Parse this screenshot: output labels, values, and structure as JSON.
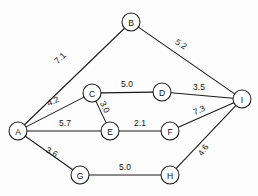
{
  "diagram": {
    "type": "weighted-undirected-graph",
    "title": "",
    "background_color": "#fdfdfd",
    "stroke_color": "#1a1a1a",
    "node_fill_color": "#ffffff",
    "node_radius": 9,
    "nodes": [
      {
        "id": "A",
        "label": "A",
        "x": 18,
        "y": 131
      },
      {
        "id": "B",
        "label": "B",
        "x": 131,
        "y": 22
      },
      {
        "id": "C",
        "label": "C",
        "x": 92,
        "y": 93
      },
      {
        "id": "D",
        "label": "D",
        "x": 162,
        "y": 92
      },
      {
        "id": "E",
        "label": "E",
        "x": 110,
        "y": 131
      },
      {
        "id": "F",
        "label": "F",
        "x": 170,
        "y": 131
      },
      {
        "id": "G",
        "label": "G",
        "x": 80,
        "y": 175
      },
      {
        "id": "H",
        "label": "H",
        "x": 170,
        "y": 175
      },
      {
        "id": "I",
        "label": "I",
        "x": 242,
        "y": 99
      }
    ],
    "edges": [
      {
        "from": "A",
        "to": "B",
        "weight": "7.1",
        "lx": 60,
        "ly": 58,
        "rot": -44
      },
      {
        "from": "B",
        "to": "I",
        "weight": "5.2",
        "lx": 181,
        "ly": 44,
        "rot": 32
      },
      {
        "from": "A",
        "to": "C",
        "weight": "4.2",
        "lx": 53,
        "ly": 101,
        "rot": -24
      },
      {
        "from": "C",
        "to": "D",
        "weight": "5.0",
        "lx": 127,
        "ly": 84,
        "rot": 0
      },
      {
        "from": "D",
        "to": "I",
        "weight": "3.5",
        "lx": 199,
        "ly": 87,
        "rot": 0
      },
      {
        "from": "C",
        "to": "E",
        "weight": "3.0",
        "lx": 105,
        "ly": 107,
        "rot": 64
      },
      {
        "from": "A",
        "to": "E",
        "weight": "5.7",
        "lx": 65,
        "ly": 123,
        "rot": 0
      },
      {
        "from": "E",
        "to": "F",
        "weight": "2.1",
        "lx": 140,
        "ly": 123,
        "rot": 0
      },
      {
        "from": "F",
        "to": "I",
        "weight": "7.3",
        "lx": 199,
        "ly": 110,
        "rot": -24
      },
      {
        "from": "A",
        "to": "G",
        "weight": "3.6",
        "lx": 52,
        "ly": 152,
        "rot": 28
      },
      {
        "from": "G",
        "to": "H",
        "weight": "5.0",
        "lx": 125,
        "ly": 167,
        "rot": 0
      },
      {
        "from": "H",
        "to": "I",
        "weight": "4.6",
        "lx": 203,
        "ly": 150,
        "rot": -56
      }
    ]
  }
}
